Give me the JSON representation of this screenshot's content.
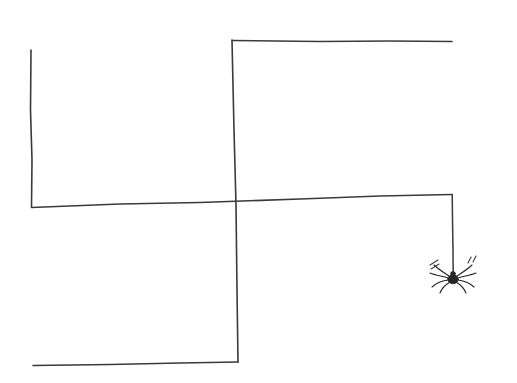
{
  "canvas": {
    "width": 517,
    "height": 383,
    "background_color": "#ffffff",
    "title": "Hand-drawn spiral path with hanging spider",
    "medium": "pen line drawing"
  },
  "style": {
    "ink_color": "#3a3a3a",
    "ink_color_dark": "#2b2b2b",
    "spider_color": "#262626",
    "sparkle_color": "#3f3f3f",
    "line_width": 1.6,
    "thread_width": 1.5,
    "leg_width": 1.1
  },
  "drawing": {
    "description": "A single continuous hand-drawn line forming a rectangular spiral, ending in a vertical thread from which a spider hangs.",
    "segments": [
      {
        "name": "upper-left-vertical",
        "label": "Upper left vertical stroke",
        "from": [
          31,
          50
        ],
        "to": [
          32,
          207
        ],
        "orientation": "vertical",
        "path": "M 31 50 L 30.5 110 L 32 160 L 31.5 207"
      },
      {
        "name": "top-horizontal",
        "label": "Top horizontal stroke",
        "from": [
          232,
          41
        ],
        "to": [
          452,
          41
        ],
        "orientation": "horizontal",
        "path": "M 232 40.5 L 320 41.5 L 390 41 L 452 41.5"
      },
      {
        "name": "center-vertical",
        "label": "Long center vertical stroke",
        "from": [
          232,
          40
        ],
        "to": [
          238,
          362
        ],
        "orientation": "vertical",
        "path": "M 232 40 L 234 130 L 236 205 L 237 290 L 238 362"
      },
      {
        "name": "middle-horizontal",
        "label": "Middle horizontal stroke",
        "from": [
          31,
          207
        ],
        "to": [
          452,
          194
        ],
        "orientation": "horizontal",
        "path": "M 31.5 207.5 L 120 204 L 200 202.5 L 300 199 L 380 196 L 452 194.5"
      },
      {
        "name": "thread-vertical",
        "label": "Spider thread vertical stroke",
        "from": [
          452,
          194
        ],
        "to": [
          453,
          274
        ],
        "orientation": "vertical",
        "path": "M 452.2 194.5 L 452.6 225 L 453 250 L 453.2 274"
      },
      {
        "name": "bottom-horizontal",
        "label": "Bottom horizontal stroke",
        "from": [
          238,
          362
        ],
        "to": [
          33,
          365
        ],
        "orientation": "horizontal",
        "path": "M 238 362 L 180 363 L 110 364.5 L 33 365.5"
      }
    ],
    "corners": [
      {
        "name": "top-left-corner",
        "point": [
          232,
          40
        ]
      },
      {
        "name": "middle-left-corner",
        "point": [
          31,
          207
        ]
      },
      {
        "name": "thread-corner",
        "point": [
          452,
          194
        ]
      },
      {
        "name": "bottom-right-corner",
        "point": [
          238,
          362
        ]
      }
    ],
    "free_ends": [
      {
        "name": "upper-left-line-end",
        "point": [
          31,
          50
        ]
      },
      {
        "name": "top-line-right-end",
        "point": [
          452,
          41
        ]
      },
      {
        "name": "bottom-line-left-end",
        "point": [
          33,
          365
        ]
      }
    ]
  },
  "spider": {
    "label": "Hanging spider",
    "center": [
      453,
      278
    ],
    "body": {
      "abdomen_rx": 5.2,
      "abdomen_ry": 4.6,
      "head_rx": 2.4,
      "head_ry": 2.0
    },
    "leg_count": 8,
    "legs": [
      {
        "name": "leg-left-1",
        "path": "M 449 276 C 443 272 438 269 434 265"
      },
      {
        "name": "leg-left-2",
        "path": "M 448 278 C 441 276 435 275 430 273"
      },
      {
        "name": "leg-left-3",
        "path": "M 448 280 C 441 281 436 283 432 287"
      },
      {
        "name": "leg-left-4",
        "path": "M 450 282 C 445 285 442 288 440 293"
      },
      {
        "name": "leg-right-1",
        "path": "M 457 276 C 463 272 468 269 472 265"
      },
      {
        "name": "leg-right-2",
        "path": "M 458 278 C 465 276 471 275 476 273"
      },
      {
        "name": "leg-right-3",
        "path": "M 458 280 C 465 281 470 283 474 287"
      },
      {
        "name": "leg-right-4",
        "path": "M 456 282 C 461 285 464 288 466 293"
      }
    ],
    "sparkles": [
      {
        "name": "sparkle-left",
        "position": [
          434,
          262
        ],
        "strokes": [
          "M 430 265 L 438 260",
          "M 431 269 L 439 264"
        ]
      },
      {
        "name": "sparkle-right",
        "position": [
          472,
          260
        ],
        "strokes": [
          "M 468 263 L 471 257",
          "M 473 262 L 476 256"
        ]
      }
    ]
  }
}
